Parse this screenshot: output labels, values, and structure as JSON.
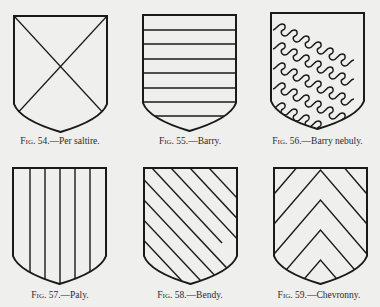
{
  "figures": [
    {
      "number": "54",
      "label": "Fig. 54.—Per saltire.",
      "prefix": "Fig.",
      "rest": "54.—Per saltire.",
      "pattern": "per-saltire"
    },
    {
      "number": "55",
      "label": "Fig. 55.—Barry.",
      "prefix": "Fig.",
      "rest": "55.—Barry.",
      "pattern": "barry"
    },
    {
      "number": "56",
      "label": "Fig. 56.—Barry nebuly.",
      "prefix": "Fig.",
      "rest": "56.—Barry nebuly.",
      "pattern": "barry-nebuly"
    },
    {
      "number": "57",
      "label": "Fig. 57.—Paly.",
      "prefix": "Fig.",
      "rest": "57.—Paly.",
      "pattern": "paly"
    },
    {
      "number": "58",
      "label": "Fig. 58.—Bendy.",
      "prefix": "Fig.",
      "rest": "58.—Bendy.",
      "pattern": "bendy"
    },
    {
      "number": "59",
      "label": "Fig. 59.—Chevronny.",
      "prefix": "Fig.",
      "rest": "59.—Chevronny.",
      "pattern": "chevronny"
    }
  ],
  "colors": {
    "background": "#efefed",
    "ink": "#1a1a1a"
  }
}
